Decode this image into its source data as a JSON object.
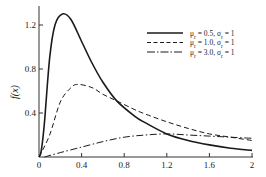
{
  "chart_data": {
    "type": "line",
    "title": "",
    "xlabel": "",
    "ylabel": "f(x)",
    "xlim": [
      0,
      2
    ],
    "ylim": [
      0,
      1.35
    ],
    "grid": false,
    "legend_position": "upper right",
    "x_ticks": [
      "0",
      "0.4",
      "0.8",
      "1.2",
      "1.6",
      "2"
    ],
    "y_ticks": [
      "0.4",
      "0.8",
      "1.2"
    ],
    "series": [
      {
        "name": "μr = 0.5, σr = 1",
        "style": "solid",
        "x": [
          0,
          0.02,
          0.05,
          0.1,
          0.15,
          0.22,
          0.3,
          0.4,
          0.5,
          0.6,
          0.73,
          0.9,
          1.0,
          1.2,
          1.4,
          1.6,
          1.8,
          2.0
        ],
        "values": [
          0,
          0.05,
          0.3,
          0.9,
          1.2,
          1.3,
          1.25,
          1.05,
          0.85,
          0.68,
          0.51,
          0.37,
          0.31,
          0.21,
          0.15,
          0.11,
          0.08,
          0.06
        ]
      },
      {
        "name": "μr = 1.0, σr = 1",
        "style": "dashed",
        "x": [
          0,
          0.1,
          0.2,
          0.3,
          0.37,
          0.5,
          0.6,
          0.73,
          0.9,
          1.0,
          1.2,
          1.4,
          1.6,
          1.8,
          2.0
        ],
        "values": [
          0,
          0.2,
          0.5,
          0.63,
          0.66,
          0.63,
          0.57,
          0.51,
          0.43,
          0.39,
          0.32,
          0.26,
          0.21,
          0.18,
          0.15
        ]
      },
      {
        "name": "μr = 3.0, σr = 1",
        "style": "dashdot",
        "x": [
          0.05,
          0.2,
          0.4,
          0.6,
          0.8,
          1.0,
          1.2,
          1.4,
          1.6,
          1.8,
          2.0
        ],
        "values": [
          0,
          0.04,
          0.09,
          0.14,
          0.18,
          0.2,
          0.21,
          0.2,
          0.19,
          0.18,
          0.17
        ]
      }
    ]
  },
  "legend": {
    "items": [
      {
        "label": "μr = 0.5, σr = 1",
        "mu": "0.5",
        "sigma": "1",
        "style": "solid"
      },
      {
        "label": "μr = 1.0, σr = 1",
        "mu": "1.0",
        "sigma": "1",
        "style": "dashed"
      },
      {
        "label": "μr = 3.0, σr = 1",
        "mu": "3.0",
        "sigma": "1",
        "style": "dashdot"
      }
    ]
  },
  "axes": {
    "ylabel": "f(x)",
    "x_ticks": [
      "0",
      "0.4",
      "0.8",
      "1.2",
      "1.6",
      "2"
    ],
    "y_ticks": [
      "0.4",
      "0.8",
      "1.2"
    ]
  },
  "colors": {
    "line": "#1a1a1a",
    "axis": "#333333"
  }
}
